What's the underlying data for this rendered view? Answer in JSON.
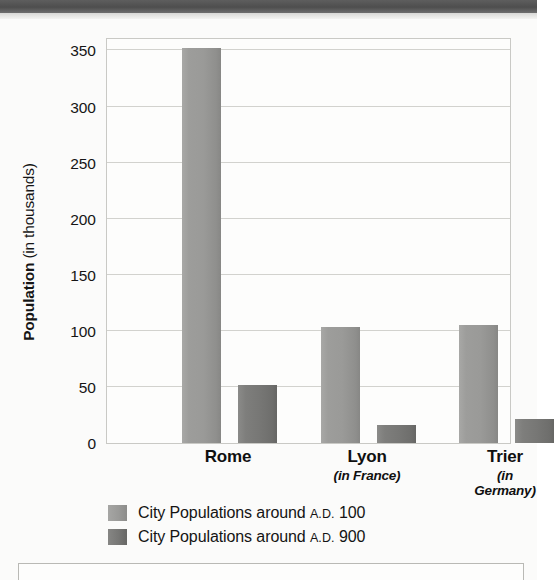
{
  "chart_data": {
    "type": "bar",
    "title": "",
    "xlabel": "",
    "ylabel": "Population (in thousands)",
    "ylabel_bold_part": "Population",
    "ylabel_normal_part": " (in thousands)",
    "categories": [
      "Rome",
      "Lyon",
      "Trier"
    ],
    "category_subtitles": [
      "",
      "(in France)",
      "(in Germany)"
    ],
    "series": [
      {
        "name": "City Populations around A.D. 100",
        "name_prefix": "City Populations around ",
        "name_era": "A.D.",
        "name_year": " 100",
        "color": "#9a9a98",
        "values": [
          352,
          103,
          105
        ]
      },
      {
        "name": "City Populations around A.D. 900",
        "name_prefix": "City Populations around ",
        "name_era": "A.D.",
        "name_year": " 900",
        "color": "#777775",
        "values": [
          52,
          16,
          21
        ]
      }
    ],
    "ylim": [
      0,
      362
    ],
    "yticks": [
      0,
      50,
      100,
      150,
      200,
      250,
      300,
      350
    ],
    "ytick_labels": [
      "0",
      "50",
      "100",
      "150",
      "200",
      "250",
      "300",
      "350"
    ],
    "grid": true,
    "grid_axis": "y",
    "legend_position": "bottom-left"
  },
  "decor": {
    "top_band_color": "#4e4e4e",
    "frame_color": "#c9c9c5",
    "grid_color": "#d2d2ce",
    "page_background": "#fbfbfa"
  }
}
